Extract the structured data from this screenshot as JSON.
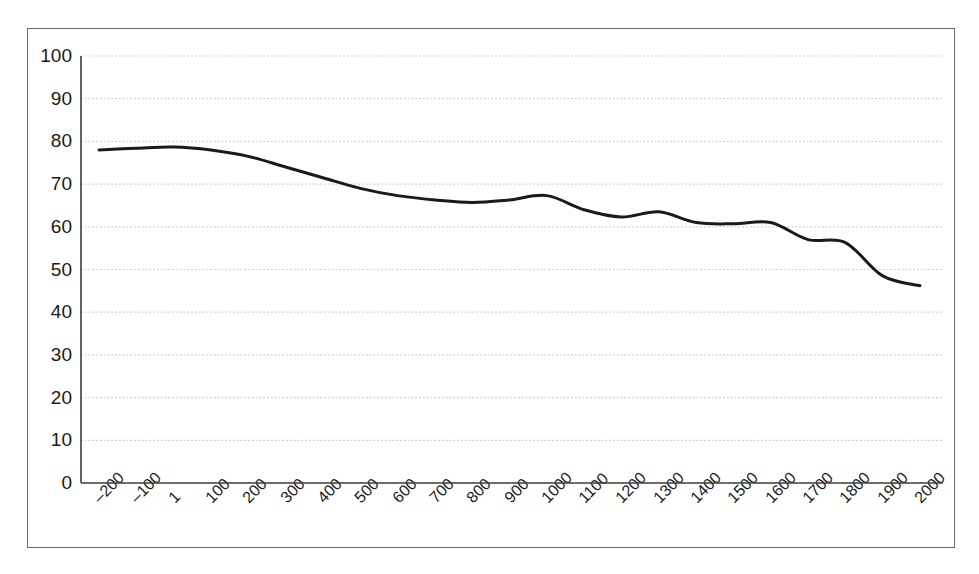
{
  "chart_data": {
    "type": "line",
    "title": "",
    "subtitle": "",
    "xlabel": "",
    "ylabel": "",
    "categories": [
      "–200",
      "–100",
      "1",
      "100",
      "200",
      "300",
      "400",
      "500",
      "600",
      "700",
      "800",
      "900",
      "1000",
      "1100",
      "1200",
      "1300",
      "1400",
      "1500",
      "1600",
      "1700",
      "1800",
      "1900",
      "2000"
    ],
    "values": [
      78.0,
      78.4,
      78.7,
      78.0,
      76.5,
      74.0,
      71.5,
      69.0,
      67.3,
      66.3,
      65.7,
      66.3,
      67.3,
      64.0,
      62.3,
      63.5,
      61.0,
      60.7,
      61.0,
      57.0,
      56.3,
      48.5,
      46.2
    ],
    "series": [
      {
        "name": "series-1",
        "values": [
          78.0,
          78.4,
          78.7,
          78.0,
          76.5,
          74.0,
          71.5,
          69.0,
          67.3,
          66.3,
          65.7,
          66.3,
          67.3,
          64.0,
          62.3,
          63.5,
          61.0,
          60.7,
          61.0,
          57.0,
          56.3,
          48.5,
          46.2
        ]
      }
    ],
    "ylim": [
      0,
      100
    ],
    "yticks": [
      0,
      10,
      20,
      30,
      40,
      50,
      60,
      70,
      80,
      90,
      100
    ],
    "ytick_labels": [
      "0",
      "10",
      "20",
      "30",
      "40",
      "50",
      "60",
      "70",
      "80",
      "90",
      "100"
    ],
    "grid": true,
    "grid_axis": "y",
    "grid_style": "dotted",
    "legend": false,
    "legend_position": "none",
    "line_color": "#1a1a1a",
    "line_width": 3,
    "grid_color": "#c8c8d2",
    "axis_color": "#3c3c3c",
    "frame_color": "#6a6a6a",
    "background_color": "#ffffff",
    "xtick_rotation": -45
  }
}
